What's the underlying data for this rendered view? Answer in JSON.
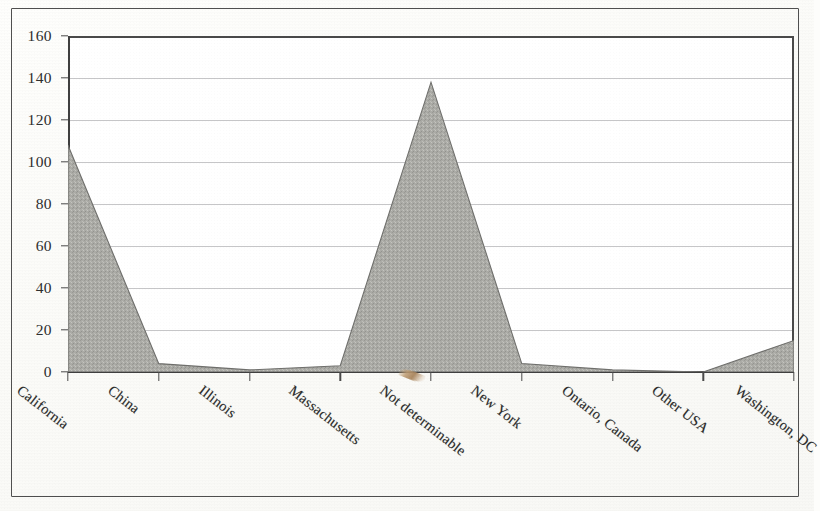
{
  "chart_data": {
    "type": "area",
    "title": "",
    "subtitle": "",
    "xlabel": "",
    "ylabel": "",
    "categories": [
      "California",
      "China",
      "Illinois",
      "Massachusetts",
      "Not determinable",
      "New York",
      "Ontario, Canada",
      "Other USA",
      "Washington, DC"
    ],
    "values": [
      108,
      4,
      1,
      3,
      138,
      4,
      1,
      0,
      15
    ],
    "ylim": [
      0,
      160
    ],
    "ytick_values": [
      0,
      20,
      40,
      60,
      80,
      100,
      120,
      140,
      160
    ],
    "ytick_labels": [
      "0",
      "20",
      "40",
      "60",
      "80",
      "100",
      "120",
      "140",
      "160"
    ],
    "grid": true,
    "legend": false,
    "legend_position": "none",
    "series": [
      {
        "name": "Count",
        "values": [
          108,
          4,
          1,
          3,
          138,
          4,
          1,
          0,
          15
        ]
      }
    ],
    "fill_color": "#ababa6",
    "line_color": "#6f6f6c",
    "axis_color": "#3f3f3f",
    "gridline_color": "#787880",
    "plot_background": "#ffffff",
    "page_background": "#fbfbf8",
    "annotations": [
      {
        "name": "scan-artifact",
        "kind": "tan-diagonal-streak",
        "near_category": "Not determinable",
        "color": "#a8845c"
      }
    ]
  }
}
